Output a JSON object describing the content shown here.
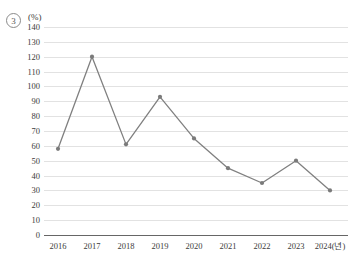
{
  "figure": {
    "item_number": "3",
    "unit_label": "(%)"
  },
  "chart_data": {
    "type": "line",
    "title": "",
    "xlabel": "2024(년)",
    "ylabel": "(%)",
    "categories": [
      "2016",
      "2017",
      "2018",
      "2019",
      "2020",
      "2021",
      "2022",
      "2023",
      "2024(년)"
    ],
    "values": [
      58,
      120,
      61,
      93,
      65,
      45,
      35,
      50,
      30
    ],
    "series": [
      {
        "name": "",
        "values": [
          58,
          120,
          61,
          93,
          65,
          45,
          35,
          50,
          30
        ]
      }
    ],
    "ylim": [
      0,
      140
    ],
    "ytick_step": 10,
    "yticks": [
      0,
      10,
      20,
      30,
      40,
      50,
      60,
      70,
      80,
      90,
      100,
      110,
      120,
      130,
      140
    ],
    "ytick_labels": [
      "0",
      "10",
      "20",
      "30",
      "40",
      "50",
      "60",
      "70",
      "80",
      "90",
      "100",
      "110",
      "120",
      "130",
      "140"
    ],
    "grid": "horizontal",
    "legend": "none",
    "marker": "circle",
    "line_color": "#808080",
    "marker_color": "#7a7a7a",
    "grid_color": "#e2e2e2",
    "axis_color": "#666666"
  }
}
